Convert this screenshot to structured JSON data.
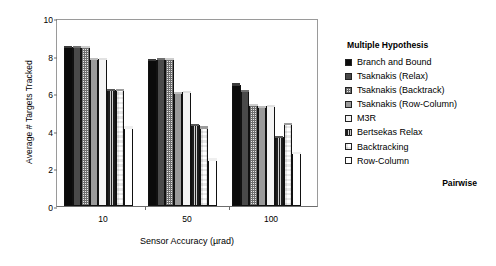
{
  "chart_data": {
    "type": "bar",
    "title": "",
    "xlabel": "Sensor Accuracy (µrad)",
    "ylabel": "Average # Targets Tracked",
    "categories": [
      "10",
      "50",
      "100"
    ],
    "ylim": [
      0,
      10
    ],
    "yticks": [
      0,
      2,
      4,
      6,
      8,
      10
    ],
    "grid": false,
    "legend_position": "right",
    "legend_title": "Multiple Hypothesis",
    "legend_footer": "Pairwise",
    "series": [
      {
        "name": "Branch and Bound",
        "fill": "f-black",
        "values": [
          8.45,
          7.75,
          6.45
        ]
      },
      {
        "name": "Tsaknakis (Relax)",
        "fill": "f-darkgray",
        "values": [
          8.45,
          7.8,
          6.1
        ]
      },
      {
        "name": "Tsaknakis (Backtrack)",
        "fill": "f-hatch",
        "values": [
          8.45,
          7.8,
          5.35
        ]
      },
      {
        "name": "Tsaknakis (Row-Column)",
        "fill": "f-midgray",
        "values": [
          7.8,
          6.0,
          5.25
        ]
      },
      {
        "name": "M3R",
        "fill": "f-white1",
        "values": [
          7.8,
          6.05,
          5.3
        ]
      },
      {
        "name": "Bertsekas Relax",
        "fill": "f-vstripe",
        "values": [
          6.15,
          4.3,
          3.65
        ]
      },
      {
        "name": "Backtracking",
        "fill": "f-check",
        "values": [
          6.15,
          4.15,
          4.35
        ]
      },
      {
        "name": "Row-Column",
        "fill": "f-white2",
        "values": [
          4.15,
          2.45,
          2.8
        ]
      }
    ]
  }
}
